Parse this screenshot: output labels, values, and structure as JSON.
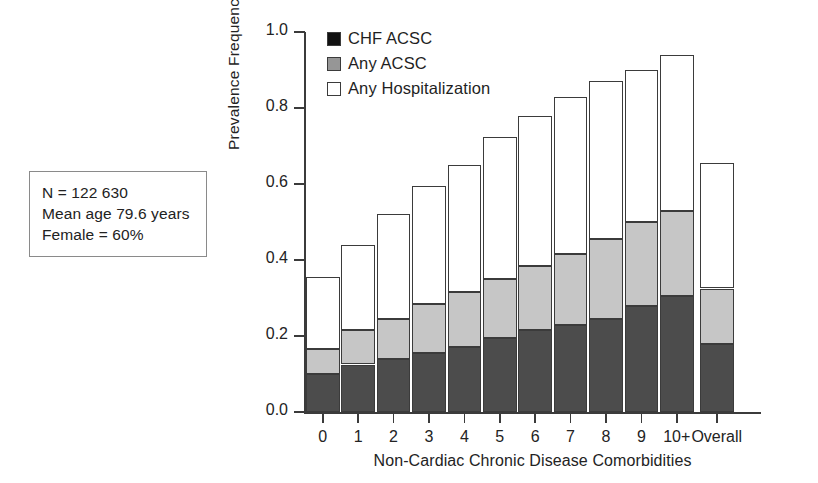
{
  "info_box": {
    "lines": [
      "N = 122 630",
      "Mean age 79.6 years",
      "Female = 60%"
    ]
  },
  "legend": {
    "position": "inside-top-left",
    "items": [
      {
        "label": "CHF ACSC",
        "swatch": "black-square-icon",
        "color": "#111111"
      },
      {
        "label": "Any ACSC",
        "swatch": "gray-square-icon",
        "color": "#969696"
      },
      {
        "label": "Any Hospitalization",
        "swatch": "white-square-icon",
        "color": "#ffffff"
      }
    ]
  },
  "chart_data": {
    "type": "bar",
    "stacked": true,
    "title": "",
    "subtitle": "",
    "xlabel": "Non-Cardiac Chronic Disease Comorbidities",
    "ylabel": "Prevalence Frequency",
    "ylim": [
      0.0,
      1.0
    ],
    "ytick_labels": [
      "0.0",
      "0.2",
      "0.4",
      "0.6",
      "0.8",
      "1.0"
    ],
    "yticks": [
      0.0,
      0.2,
      0.4,
      0.6,
      0.8,
      1.0
    ],
    "grid": false,
    "legend_position": "upper left inside",
    "categories": [
      "0",
      "1",
      "2",
      "3",
      "4",
      "5",
      "6",
      "7",
      "8",
      "9",
      "10+",
      "Overall"
    ],
    "series": [
      {
        "name": "CHF ACSC",
        "color": "#4c4c4c",
        "values": [
          0.1,
          0.125,
          0.14,
          0.155,
          0.17,
          0.195,
          0.215,
          0.23,
          0.245,
          0.28,
          0.305,
          0.18
        ]
      },
      {
        "name": "Any ACSC",
        "color": "#c6c6c6",
        "values": [
          0.165,
          0.215,
          0.245,
          0.285,
          0.315,
          0.35,
          0.385,
          0.415,
          0.455,
          0.5,
          0.53,
          0.325
        ]
      },
      {
        "name": "Any Hospitalization",
        "color": "#ffffff",
        "values": [
          0.355,
          0.44,
          0.52,
          0.595,
          0.65,
          0.725,
          0.78,
          0.83,
          0.87,
          0.9,
          0.94,
          0.655
        ]
      }
    ],
    "note": "Series values are cumulative top-of-segment heights: CHF ACSC is innermost, Any ACSC includes CHF, Any Hospitalization is the full bar height."
  }
}
